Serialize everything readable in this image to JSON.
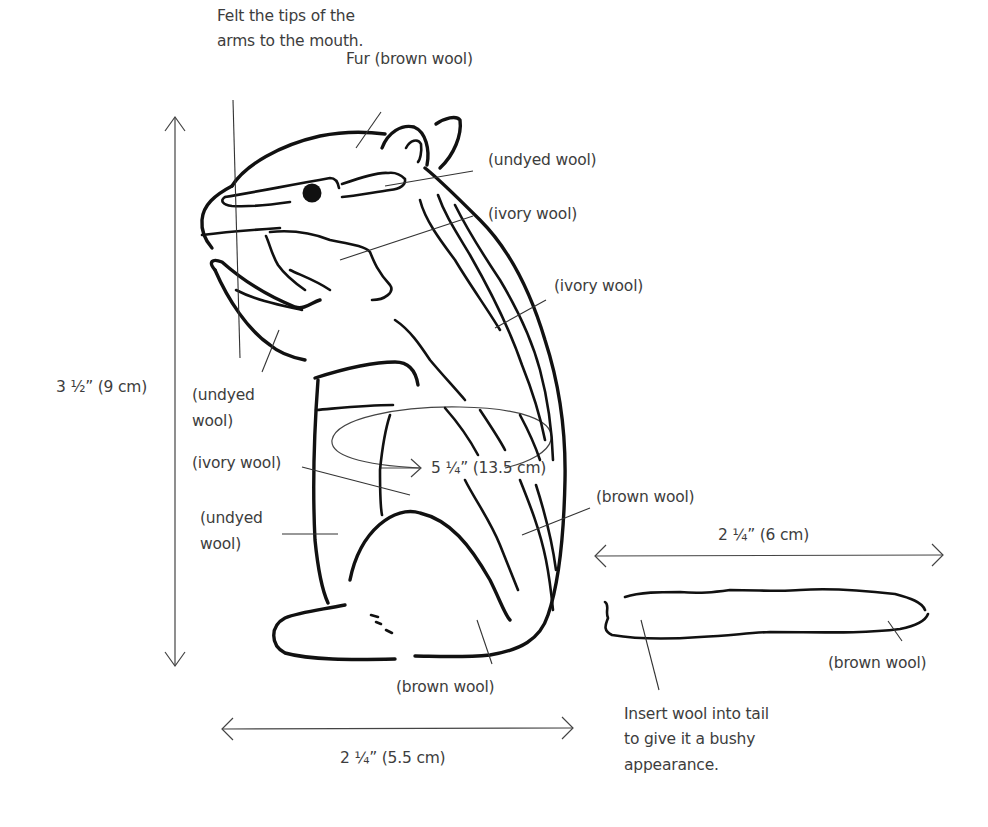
{
  "diagram": {
    "labels": {
      "felt_tips_line1": "Felt the tips of the",
      "felt_tips_line2": "arms to the mouth.",
      "fur": "Fur (brown wool)",
      "undyed_eye": "(undyed wool)",
      "ivory_cheek": "(ivory wool)",
      "ivory_back": "(ivory wool)",
      "undyed_arm_line1": "(undyed",
      "undyed_arm_line2": "wool)",
      "ivory_belly": "(ivory wool)",
      "undyed_body_line1": "(undyed",
      "undyed_body_line2": "wool)",
      "brown_side": "(brown wool)",
      "brown_foot": "(brown wool)",
      "brown_tail": "(brown wool)",
      "tail_note_line1": "Insert wool into tail",
      "tail_note_line2": "to give it a bushy",
      "tail_note_line3": "appearance."
    },
    "dimensions": {
      "height": "3 ½” (9 cm)",
      "girth": "5 ¼” (13.5 cm)",
      "body_length": "2 ¼” (5.5 cm)",
      "tail_length": "2 ¼” (6 cm)"
    },
    "colors": {
      "ink": "#111111",
      "text": "#3d3d3d",
      "background": "#ffffff"
    }
  }
}
